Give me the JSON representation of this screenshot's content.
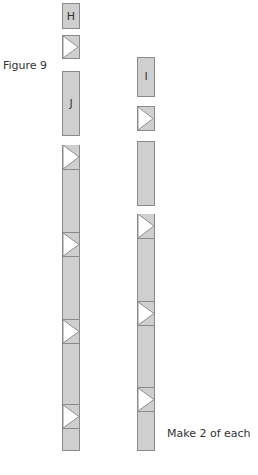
{
  "figure": {
    "title": "Figure 9",
    "note": "Make 2 of each",
    "colors": {
      "fill": "#cfcfcf",
      "stroke": "#8a8a8a",
      "triangle": "#ffffff"
    }
  },
  "pieces": {
    "H": {
      "label": "H"
    },
    "J": {
      "label": "J"
    },
    "I": {
      "label": "I"
    }
  }
}
